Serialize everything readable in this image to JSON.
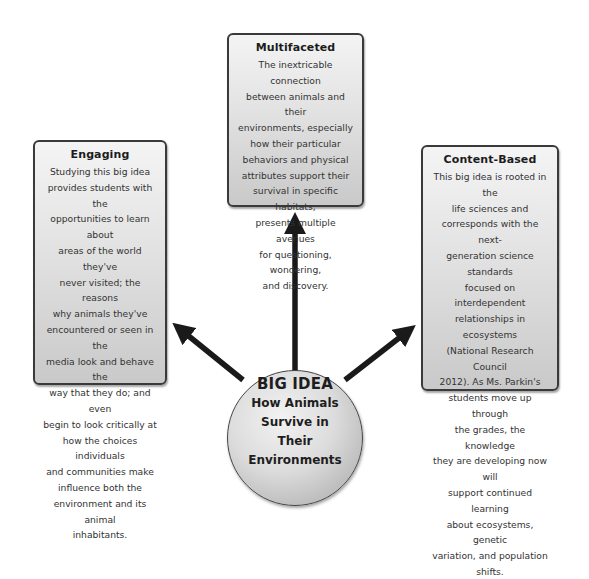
{
  "diagram": {
    "center": {
      "title": "BIG IDEA",
      "subtitle_lines": [
        "How Animals",
        "Survive in",
        "Their",
        "Environments"
      ]
    },
    "boxes": {
      "multifaceted": {
        "title": "Multifaceted",
        "lines": [
          "The inextricable connection",
          "between animals and their",
          "environments, especially",
          "how their particular",
          "behaviors and physical",
          "attributes support their",
          "survival in specific habitats,",
          "presents multiple avenues",
          "for questioning, wondering,",
          "and discovery."
        ]
      },
      "engaging": {
        "title": "Engaging",
        "lines": [
          "Studying this big idea",
          "provides students with the",
          "opportunities to learn about",
          "areas of the world they've",
          "never visited; the reasons",
          "why animals they've",
          "encountered or seen in the",
          "media look and behave the",
          "way that they do; and even",
          "begin to look critically at",
          "how the choices individuals",
          "and communities make",
          "influence both the",
          "environment and its animal",
          "inhabitants."
        ]
      },
      "content_based": {
        "title": "Content-Based",
        "lines": [
          "This big idea is rooted in the",
          "life sciences and",
          "corresponds with the next-",
          "generation science standards",
          "focused on interdependent",
          "relationships in ecosystems",
          "(National Research Council",
          "2012). As Ms. Parkin's",
          "students move up through",
          "the grades, the knowledge",
          "they are developing now will",
          "support continued learning",
          "about ecosystems, genetic",
          "variation, and population",
          "shifts."
        ]
      }
    },
    "colors": {
      "arrow": "#1a1a1a",
      "box_border": "#3a3a3a",
      "box_fill_top": "#f4f4f4",
      "box_fill_bottom": "#c9c9c9"
    }
  }
}
